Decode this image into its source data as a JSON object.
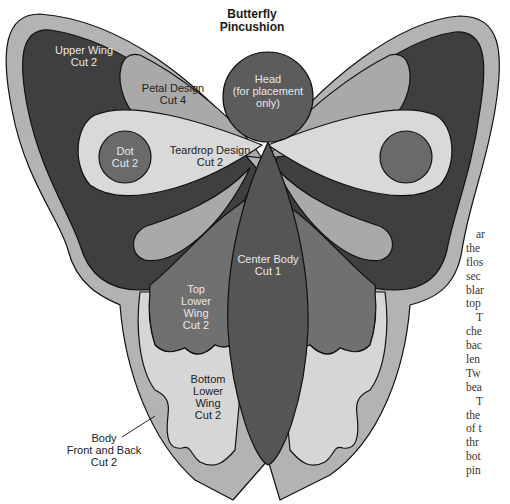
{
  "diagram": {
    "title_line1": "Butterfly",
    "title_line2": "Pincushion",
    "colors": {
      "outline": "#111111",
      "body_outer": "#b3b3b3",
      "upper_wing": "#3f3f3f",
      "petal": "#a9a9a9",
      "teardrop": "#d9d9d9",
      "dot": "#6a6a6a",
      "head": "#5c5c5c",
      "center_body": "#555555",
      "top_lower_wing": "#707070",
      "bottom_lower_wing": "#d6d6d6",
      "background": "#ffffff"
    },
    "pieces": {
      "upper_wing": {
        "line1": "Upper Wing",
        "line2": "Cut 2"
      },
      "petal": {
        "line1": "Petal Design",
        "line2": "Cut 4"
      },
      "head": {
        "line1": "Head",
        "line2": "(for placement",
        "line3": "only)"
      },
      "dot": {
        "line1": "Dot",
        "line2": "Cut 2"
      },
      "teardrop": {
        "line1": "Teardrop Design",
        "line2": "Cut 2"
      },
      "center_body": {
        "line1": "Center Body",
        "line2": "Cut 1"
      },
      "top_lower_wing": {
        "line1": "Top",
        "line2": "Lower",
        "line3": "Wing",
        "line4": "Cut 2"
      },
      "bottom_lower_wing": {
        "line1": "Bottom",
        "line2": "Lower",
        "line3": "Wing",
        "line4": "Cut 2"
      },
      "body": {
        "line1": "Body",
        "line2": "Front and Back",
        "line3": "Cut 2"
      }
    }
  },
  "side_text": {
    "lines": [
      "ar",
      "the",
      "flos",
      "sec",
      "blar",
      "top",
      "T",
      "che",
      "bac",
      "len",
      "Tw",
      "bea",
      "T",
      "the",
      "of t",
      "thr",
      "bot",
      "pin"
    ]
  }
}
